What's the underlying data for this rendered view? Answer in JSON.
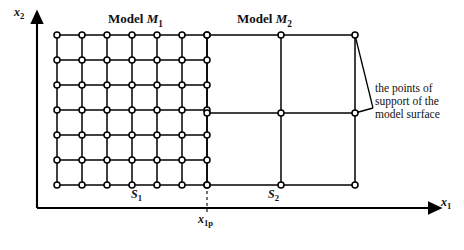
{
  "figure": {
    "type": "diagram",
    "background": "#ffffff",
    "ink_color": "#000000",
    "node_fill": "#ffffff",
    "node_stroke": "#000000"
  },
  "axes": {
    "y": {
      "label": "x",
      "sub": "2",
      "x_px": 37,
      "top_px": 18,
      "bottom_px": 208,
      "arrow": "up"
    },
    "x": {
      "label": "x",
      "sub": "1",
      "y_px": 208,
      "left_px": 37,
      "right_px": 436,
      "arrow": "right"
    }
  },
  "titles": {
    "model_1": {
      "prefix": "Model ",
      "symbol": "M",
      "sub": "1"
    },
    "model_2": {
      "prefix": "Model ",
      "symbol": "M",
      "sub": "2"
    }
  },
  "region_labels": {
    "s1": {
      "symbol": "S",
      "sub": "1"
    },
    "s2": {
      "symbol": "S",
      "sub": "2"
    },
    "x1p": {
      "symbol": "x",
      "sub": "1p"
    }
  },
  "annotation": {
    "lines": [
      "the points of",
      "support of the",
      "model surface"
    ],
    "leader_targets": [
      [
        355,
        35
      ],
      [
        355,
        113
      ]
    ],
    "leader_origin": [
      373,
      108
    ]
  },
  "grids": {
    "model_1": {
      "name": "dense-grid",
      "x_start": 57,
      "x_end": 207,
      "y_start": 35,
      "y_end": 185,
      "columns": 7,
      "rows": 7,
      "cell_w": 25,
      "cell_h": 25,
      "node_radius": 3.0
    },
    "model_2": {
      "name": "coarse-grid",
      "x_nodes": [
        207,
        281,
        355
      ],
      "y_nodes": [
        35,
        113,
        185
      ],
      "node_radius": 3.0
    }
  },
  "dashed_line": {
    "x_px": 207,
    "y_top": 185,
    "y_bottom": 212
  }
}
